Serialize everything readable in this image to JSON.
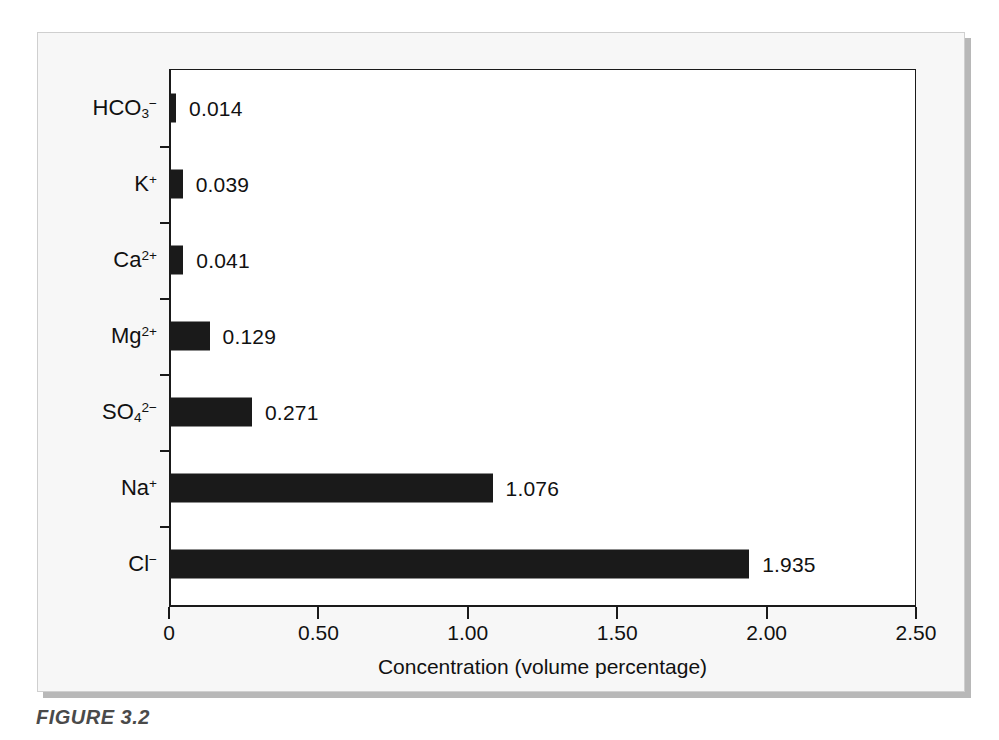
{
  "caption": "FIGURE 3.2",
  "chart_data": {
    "type": "bar",
    "orientation": "horizontal",
    "title": "",
    "xlabel": "Concentration (volume percentage)",
    "ylabel": "",
    "xlim": [
      0,
      2.5
    ],
    "xticks": [
      "0",
      "0.50",
      "1.00",
      "1.50",
      "2.00",
      "2.50"
    ],
    "xtick_values": [
      0,
      0.5,
      1.0,
      1.5,
      2.0,
      2.5
    ],
    "grid": false,
    "legend": "none",
    "bar_color": "#1a1a1a",
    "categories": [
      "HCO3-",
      "K+",
      "Ca2+",
      "Mg2+",
      "SO42-",
      "Na+",
      "Cl-"
    ],
    "values": [
      0.014,
      0.039,
      0.041,
      0.129,
      0.271,
      1.076,
      1.935
    ],
    "value_labels": [
      "0.014",
      "0.039",
      "0.041",
      "0.129",
      "0.271",
      "1.076",
      "1.935"
    ],
    "items": [
      {
        "label_base": "HCO",
        "label_sub": "3",
        "label_sup": "−",
        "value": 0.014,
        "value_label": "0.014"
      },
      {
        "label_base": "K",
        "label_sub": "",
        "label_sup": "+",
        "value": 0.039,
        "value_label": "0.039"
      },
      {
        "label_base": "Ca",
        "label_sub": "",
        "label_sup": "2+",
        "value": 0.041,
        "value_label": "0.041"
      },
      {
        "label_base": "Mg",
        "label_sub": "",
        "label_sup": "2+",
        "value": 0.129,
        "value_label": "0.129"
      },
      {
        "label_base": "SO",
        "label_sub": "4",
        "label_sup": "2−",
        "value": 0.271,
        "value_label": "0.271"
      },
      {
        "label_base": "Na",
        "label_sub": "",
        "label_sup": "+",
        "value": 1.076,
        "value_label": "1.076"
      },
      {
        "label_base": "Cl",
        "label_sub": "",
        "label_sup": "−",
        "value": 1.935,
        "value_label": "1.935"
      }
    ]
  }
}
